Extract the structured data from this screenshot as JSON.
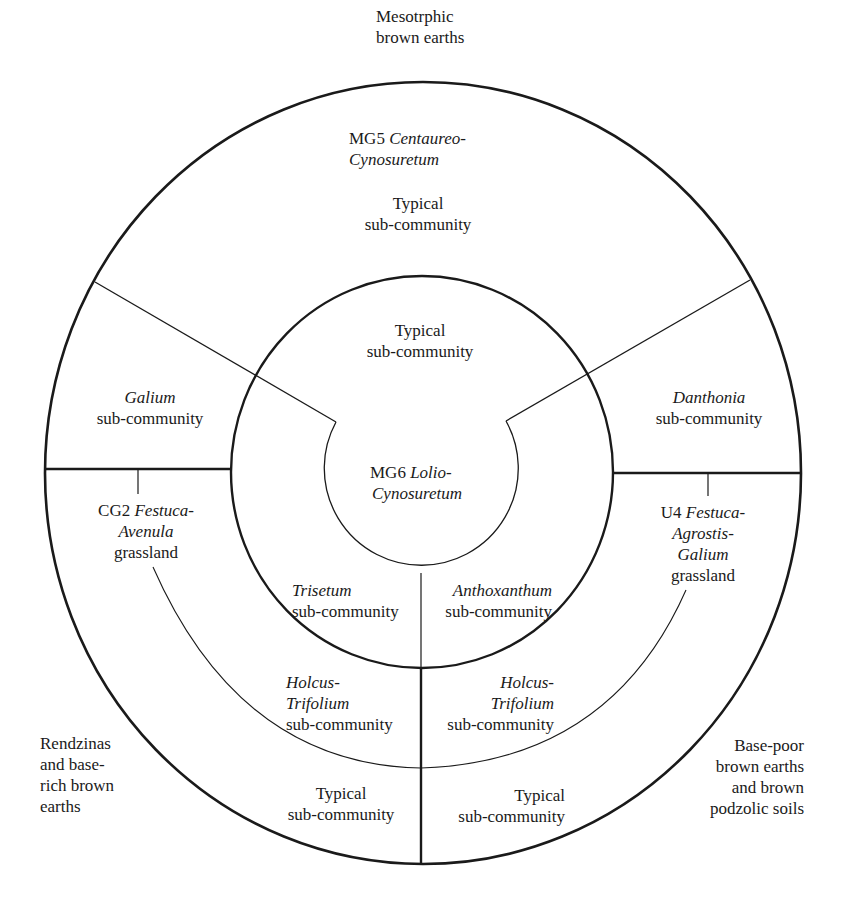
{
  "diagram": {
    "type": "concentric community-soil diagram",
    "soils": {
      "top": [
        "Mesotrphic",
        "brown earths"
      ],
      "left": [
        "Rendzinas",
        "and base-",
        "rich brown",
        "earths"
      ],
      "right": [
        "Base-poor",
        "brown earths",
        "and brown",
        "podzolic soils"
      ]
    },
    "outer_ring": {
      "mg5": {
        "code": "MG5",
        "name_a": "Centaureo-",
        "name_b": "Cynosuretum"
      },
      "mg5_typical": [
        "Typical",
        "sub-community"
      ],
      "galium": {
        "genus": "Galium",
        "suffix": "sub-community"
      },
      "danthonia": {
        "genus": "Danthonia",
        "suffix": "sub-community"
      },
      "cg2": {
        "code": "CG2",
        "name_a": "Festuca-",
        "name_b": "Avenula",
        "suffix": "grassland"
      },
      "u4": {
        "code": "U4",
        "name_a": "Festuca-",
        "name_b": "Agrostis-",
        "name_c": "Galium",
        "suffix": "grassland"
      },
      "holcus_left": {
        "genus_a": "Holcus-",
        "genus_b": "Trifolium",
        "suffix": "sub-community"
      },
      "holcus_right": {
        "genus_a": "Holcus-",
        "genus_b": "Trifolium",
        "suffix": "sub-community"
      },
      "typical_bottom_left": [
        "Typical",
        "sub-community"
      ],
      "typical_bottom_right": [
        "Typical",
        "sub-community"
      ]
    },
    "middle_ring": {
      "typical_top": [
        "Typical",
        "sub-community"
      ],
      "trisetum": {
        "genus": "Trisetum",
        "suffix": "sub-community"
      },
      "anthoxanthum": {
        "genus": "Anthoxanthum",
        "suffix": "sub-community"
      }
    },
    "core": {
      "code": "MG6",
      "name_a": "Lolio-",
      "name_b": "Cynosuretum"
    },
    "colors": {
      "ink": "#1a1a1a",
      "background": "#ffffff"
    }
  }
}
